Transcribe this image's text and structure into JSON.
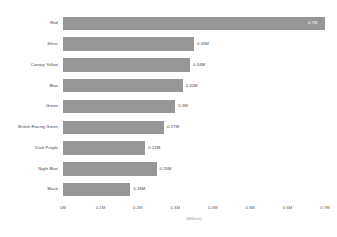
{
  "chart_data": {
    "type": "bar",
    "orientation": "horizontal",
    "title": "",
    "xlabel": "(Millions)",
    "ylabel": "",
    "categories": [
      "Red",
      "Silver",
      "Canary Yellow",
      "Blue",
      "Green",
      "British Racing Green",
      "Dark Purple",
      "Night Blue",
      "Black"
    ],
    "values": [
      0.7,
      0.35,
      0.34,
      0.32,
      0.3,
      0.27,
      0.22,
      0.25,
      0.18
    ],
    "value_labels": [
      "0.7M",
      "0.35M",
      "0.34M",
      "0.32M",
      "0.3M",
      "0.27M",
      "0.22M",
      "0.25M",
      "0.18M"
    ],
    "label_placement": [
      "inside",
      "outside",
      "outside",
      "outside",
      "outside",
      "outside",
      "outside",
      "outside",
      "outside"
    ],
    "xlim": [
      0,
      0.7
    ],
    "xticks": [
      0,
      0.1,
      0.2,
      0.3,
      0.4,
      0.5,
      0.6,
      0.7
    ],
    "xtick_labels": [
      "0M",
      "0.1M",
      "0.2M",
      "0.3M",
      "0.4M",
      "0.5M",
      "0.6M",
      "0.7M"
    ],
    "grid": false,
    "legend": false,
    "bar_color": "#969696",
    "text_color": "#3f3f3f",
    "background": "#ffffff"
  }
}
